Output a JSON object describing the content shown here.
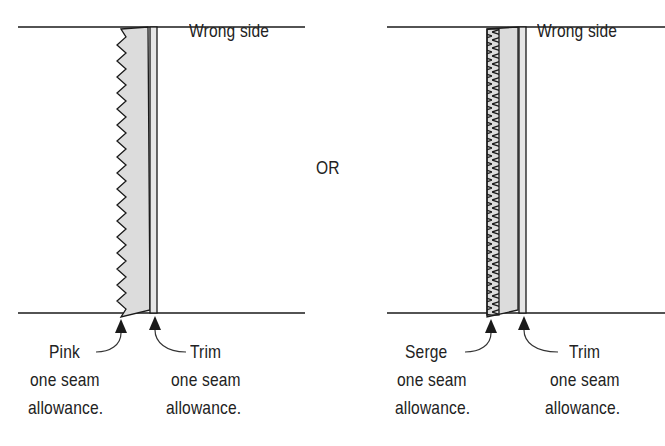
{
  "diagram": {
    "divider_label": "OR",
    "left_panel": {
      "side_label": "Wrong side",
      "edge_finish": "pinked zigzag edge",
      "callout_left": {
        "line1": "Pink",
        "line2": "one seam",
        "line3": "allowance."
      },
      "callout_right": {
        "line1": "Trim",
        "line2": "one seam",
        "line3": "allowance."
      }
    },
    "right_panel": {
      "side_label": "Wrong side",
      "edge_finish": "serged edge",
      "callout_left": {
        "line1": "Serge",
        "line2": "one seam",
        "line3": "allowance."
      },
      "callout_right": {
        "line1": "Trim",
        "line2": "one seam",
        "line3": "allowance."
      }
    },
    "colors": {
      "line": "#1a1a1a",
      "allowance_fill": "#dcdcdc",
      "text": "#222222"
    }
  }
}
